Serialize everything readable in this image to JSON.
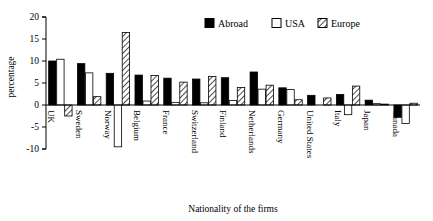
{
  "chart_data": {
    "type": "bar",
    "title": "",
    "xlabel": "Nationality of the firms",
    "ylabel": "percentage",
    "ylim": [
      -10,
      20
    ],
    "yticks": [
      20,
      15,
      10,
      5,
      0,
      -5,
      -10
    ],
    "ytick_labels": [
      "20",
      "15",
      "10",
      "5",
      "0",
      "-5",
      "-10"
    ],
    "grid": false,
    "legend_position": "top-right",
    "categories": [
      "UK",
      "Sweden",
      "Norway",
      "Belgium",
      "France",
      "Switzerland",
      "Finland",
      "Netherlands",
      "Germany",
      "United States",
      "Italy",
      "Japan",
      "Canada"
    ],
    "series": [
      {
        "name": "Abroad",
        "fill": "solid-black",
        "color": "#000000",
        "values": [
          10.0,
          9.4,
          7.2,
          6.8,
          6.1,
          5.9,
          6.2,
          7.5,
          3.9,
          2.2,
          2.4,
          1.1,
          -2.8
        ]
      },
      {
        "name": "USA",
        "fill": "white-outline",
        "color": "#ffffff",
        "values": [
          10.4,
          7.3,
          -9.5,
          0.9,
          0.6,
          0.5,
          1.0,
          3.6,
          3.5,
          0.0,
          -2.2,
          0.3,
          -4.2
        ]
      },
      {
        "name": "Europe",
        "fill": "hatched",
        "color": "#ffffff",
        "values": [
          -2.5,
          1.9,
          16.5,
          6.7,
          5.2,
          6.5,
          4.0,
          4.5,
          1.2,
          1.6,
          4.3,
          0.2,
          0.4
        ]
      }
    ]
  },
  "legend": {
    "items": [
      {
        "label": "Abroad",
        "swatch": "solid-black"
      },
      {
        "label": "USA",
        "swatch": "white-outline"
      },
      {
        "label": "Europe",
        "swatch": "hatched"
      }
    ]
  }
}
